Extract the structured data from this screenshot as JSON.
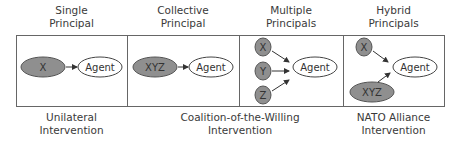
{
  "panels": [
    {
      "title_line1": "Single",
      "title_line2": "Principal",
      "nodes": [
        {
          "label": "X",
          "type": "principal"
        },
        {
          "label": "Agent",
          "type": "agent"
        }
      ]
    },
    {
      "title_line1": "Collective",
      "title_line2": "Principal",
      "nodes": [
        {
          "label": "XYZ",
          "type": "principal"
        },
        {
          "label": "Agent",
          "type": "agent"
        }
      ]
    },
    {
      "title_line1": "Multiple",
      "title_line2": "Principals",
      "nodes": [
        {
          "label": "X",
          "type": "principal"
        },
        {
          "label": "Y",
          "type": "principal"
        },
        {
          "label": "Z",
          "type": "principal"
        },
        {
          "label": "Agent",
          "type": "agent"
        }
      ]
    },
    {
      "title_line1": "Hybrid",
      "title_line2": "Principals",
      "nodes": [
        {
          "label": "X",
          "type": "principal"
        },
        {
          "label": "XYZ",
          "type": "principal"
        },
        {
          "label": "Agent",
          "type": "agent"
        }
      ]
    }
  ],
  "captions": [
    {
      "line1": "Unilateral",
      "line2": "Intervention"
    },
    {
      "line1": "Coalition-of-the-Willing",
      "line2": "Intervention"
    },
    {
      "line1": "NATO Alliance",
      "line2": "Intervention"
    }
  ],
  "colors": {
    "principal_fill": "#8f8f8f",
    "agent_fill": "#ffffff",
    "stroke": "#444444",
    "box_border": "#666666"
  }
}
